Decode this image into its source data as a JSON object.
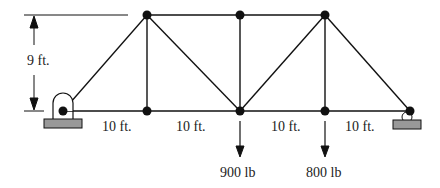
{
  "diagram": {
    "type": "truss",
    "dimensions": {
      "height_label": "9 ft.",
      "panel_labels": [
        "10 ft.",
        "10 ft.",
        "10 ft.",
        "10 ft."
      ]
    },
    "loads": [
      {
        "label": "900 lb",
        "node": "bottom-3"
      },
      {
        "label": "800 lb",
        "node": "bottom-4"
      }
    ],
    "supports": [
      {
        "type": "pin",
        "position": "left"
      },
      {
        "type": "roller",
        "position": "right"
      }
    ],
    "colors": {
      "line": "#111111",
      "support_fill": "#999999"
    }
  }
}
